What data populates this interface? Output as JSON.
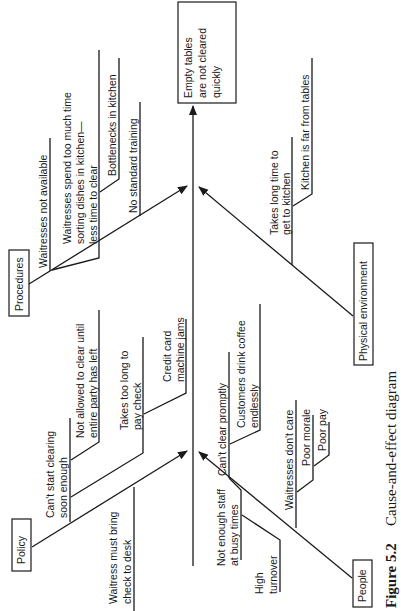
{
  "effect": {
    "lines": [
      "Empty tables",
      "are not cleared",
      "quickly"
    ]
  },
  "categories": {
    "procedures": {
      "label": "Procedures",
      "causes": [
        {
          "lines": [
            "Waitresses not available"
          ]
        },
        {
          "lines": [
            "Waitresses spend too much time",
            "sorting dishes in kitchen—",
            "less time to clear"
          ],
          "sub": {
            "lines": [
              "Bottlenecks in kitchen"
            ]
          }
        },
        {
          "lines": [
            "No standard training"
          ]
        }
      ]
    },
    "physical_environment": {
      "label": "Physical environment",
      "causes": [
        {
          "lines": [
            "Takes long time to",
            "get to kitchen"
          ],
          "sub": {
            "lines": [
              "Kitchen is far from tables"
            ]
          }
        }
      ]
    },
    "policy": {
      "label": "Policy",
      "causes": [
        {
          "lines": [
            "Can't start clearing",
            "soon enough"
          ],
          "sub": {
            "lines": [
              "Not allowed to clear until",
              "entire party has left"
            ]
          }
        },
        {
          "lines": [
            "Takes too long to",
            "pay check"
          ],
          "sub": {
            "lines": [
              "Credit card",
              "machine jams"
            ]
          }
        },
        {
          "lines": [
            "Waitress must bring",
            "check to desk"
          ]
        }
      ]
    },
    "people": {
      "label": "People",
      "causes": [
        {
          "lines": [
            "Can't clear promptly"
          ],
          "sub": {
            "lines": [
              "Customers drink coffee",
              "endlessly"
            ]
          }
        },
        {
          "lines": [
            "Not enough staff",
            "at busy times"
          ],
          "sub": {
            "lines": [
              "High",
              "turnover"
            ]
          }
        },
        {
          "lines": [
            "Waitresses don't care"
          ],
          "sub": {
            "lines": [
              "Poor morale"
            ],
            "sub": {
              "lines": [
                "Poor pay"
              ]
            }
          }
        }
      ]
    }
  },
  "caption": {
    "figure": "Figure 5.2",
    "title": "Cause-and-effect diagram"
  }
}
